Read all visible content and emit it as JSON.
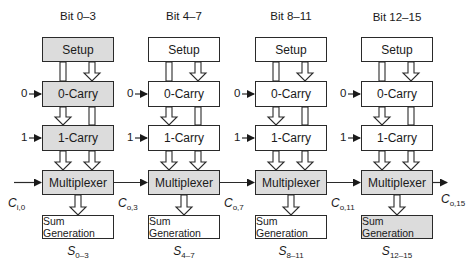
{
  "diagram": {
    "type": "block-diagram",
    "shade_color": "#dcdcdc",
    "line_color": "#2a2a2a",
    "columns": [
      {
        "title": "Bit 0–3",
        "blocks": {
          "setup": {
            "label": "Setup",
            "shaded": true
          },
          "carry0": {
            "label": "0-Carry",
            "shaded": true,
            "input": "0"
          },
          "carry1": {
            "label": "1-Carry",
            "shaded": true,
            "input": "1"
          },
          "mux": {
            "label": "Multiplexer",
            "shaded": true
          },
          "sum": {
            "label": "Sum Generation",
            "shaded": false
          }
        },
        "carry_in": {
          "main": "C",
          "sub": "i,0"
        },
        "sum_out": {
          "main": "S",
          "sub": "0–3"
        }
      },
      {
        "title": "Bit 4–7",
        "blocks": {
          "setup": {
            "label": "Setup",
            "shaded": false
          },
          "carry0": {
            "label": "0-Carry",
            "shaded": false,
            "input": "0"
          },
          "carry1": {
            "label": "1-Carry",
            "shaded": false,
            "input": "1"
          },
          "mux": {
            "label": "Multiplexer",
            "shaded": true
          },
          "sum": {
            "label": "Sum Generation",
            "shaded": false
          }
        },
        "carry_in": {
          "main": "C",
          "sub": "o,3"
        },
        "sum_out": {
          "main": "S",
          "sub": "4–7"
        }
      },
      {
        "title": "Bit 8–11",
        "blocks": {
          "setup": {
            "label": "Setup",
            "shaded": false
          },
          "carry0": {
            "label": "0-Carry",
            "shaded": false,
            "input": "0"
          },
          "carry1": {
            "label": "1-Carry",
            "shaded": false,
            "input": "1"
          },
          "mux": {
            "label": "Multiplexer",
            "shaded": true
          },
          "sum": {
            "label": "Sum Generation",
            "shaded": false
          }
        },
        "carry_in": {
          "main": "C",
          "sub": "o,7"
        },
        "sum_out": {
          "main": "S",
          "sub": "8–11"
        }
      },
      {
        "title": "Bit 12–15",
        "blocks": {
          "setup": {
            "label": "Setup",
            "shaded": false
          },
          "carry0": {
            "label": "0-Carry",
            "shaded": false,
            "input": "0"
          },
          "carry1": {
            "label": "1-Carry",
            "shaded": false,
            "input": "1"
          },
          "mux": {
            "label": "Multiplexer",
            "shaded": true
          },
          "sum": {
            "label": "Sum Generation",
            "shaded": true
          }
        },
        "carry_in": {
          "main": "C",
          "sub": "o,11"
        },
        "sum_out": {
          "main": "S",
          "sub": "12–15"
        }
      }
    ],
    "carry_out": {
      "main": "C",
      "sub": "o,15"
    }
  }
}
